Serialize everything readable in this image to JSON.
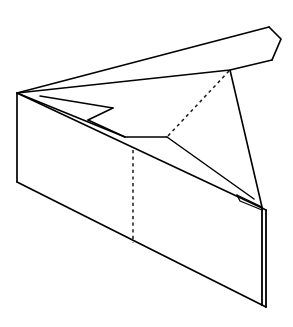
{
  "figure": {
    "title": "Wedge-shaped open carton line drawing",
    "background_color": "#ffffff",
    "line_color": "#000000",
    "hidden_line_color": "#1a1a1a",
    "canvas": {
      "width": 293,
      "height": 327
    },
    "stroke_widths": {
      "outline": 1.7,
      "interior": 1.5,
      "thin": 1.2,
      "hidden": 1.5
    },
    "dash_pattern": "3.2 3.4",
    "parts": [
      {
        "name": "lid-flap",
        "label": "Top lid flap",
        "points": "17,93 269,27 281,39 272,60 230,70"
      },
      {
        "name": "front-panel",
        "label": "Front panel",
        "points": "17,93 17,182 262,305 262,208"
      },
      {
        "name": "right-edge-panel",
        "label": "Right thickness edge",
        "points": "262,208 266,210 266,307 262,305"
      },
      {
        "name": "top-rim",
        "label": "Top rim of front panel",
        "points": "17,93 262,208"
      },
      {
        "name": "inner-tongue",
        "label": "Inner folded tongue panel",
        "points": "17,93 113,108 88,120 125,137 167,137 254,199"
      },
      {
        "name": "sliver-wedge",
        "label": "Thin wedge sliver",
        "points": "237,195 254,199 262,208"
      },
      {
        "name": "hidden-fold-diagonal",
        "label": "Hidden diagonal fold line",
        "points": "230,70 167,137"
      },
      {
        "name": "hidden-fold-vertical",
        "label": "Hidden vertical fold line",
        "points": "133,150 133,243"
      },
      {
        "name": "lid-hinge-drop",
        "label": "Lid hinge drop edge",
        "points": "230,70 262,208"
      }
    ]
  }
}
